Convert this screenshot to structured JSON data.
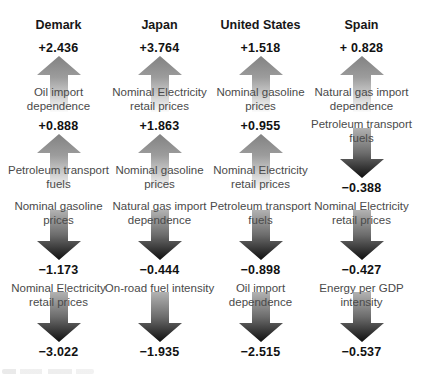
{
  "figure": {
    "colors": {
      "value_text": "#111111",
      "label_text": "#4a4a4a",
      "up_arrow_top": "#828282",
      "up_arrow_bottom": "#fbfbfb",
      "down_arrow_top": "#b2b2b2",
      "down_arrow_bottom": "#0f0f0f",
      "background": "#ffffff"
    },
    "columns": [
      {
        "country": "Demark",
        "items": [
          {
            "direction": "up",
            "value": "+2.436",
            "label": "Oil import dependence"
          },
          {
            "direction": "up",
            "value": "+0.888",
            "label": "Petroleum transport fuels"
          },
          {
            "direction": "down",
            "value": "−1.173",
            "label": "Nominal gasoline prices"
          },
          {
            "direction": "down",
            "value": "−3.022",
            "label": "Nominal Electricity retail prices"
          }
        ]
      },
      {
        "country": "Japan",
        "items": [
          {
            "direction": "up",
            "value": "+3.764",
            "label": "Nominal Electricity retail prices"
          },
          {
            "direction": "up",
            "value": "+1.863",
            "label": "Nominal gasoline prices"
          },
          {
            "direction": "down",
            "value": "−0.444",
            "label": "Natural gas import dependence"
          },
          {
            "direction": "down",
            "value": "−1.935",
            "label": "On-road fuel intensity"
          }
        ]
      },
      {
        "country": "United States",
        "items": [
          {
            "direction": "up",
            "value": "+1.518",
            "label": "Nominal gasoline prices"
          },
          {
            "direction": "up",
            "value": "+0.955",
            "label": "Nominal Electricity retail prices"
          },
          {
            "direction": "down",
            "value": "−0.898",
            "label": "Petroleum transport fuels"
          },
          {
            "direction": "down",
            "value": "−2.515",
            "label": "Oil import dependence"
          }
        ]
      },
      {
        "country": "Spain",
        "items": [
          {
            "direction": "up",
            "value": "+ 0.828",
            "label": "Natural gas import dependence"
          },
          {
            "direction": "down",
            "value": "−0.388",
            "label": "Petroleum transport fuels"
          },
          {
            "direction": "down",
            "value": "−0.427",
            "label": "Nominal Electricity retail prices"
          },
          {
            "direction": "down",
            "value": "−0.537",
            "label": "Energy per GDP intensity"
          }
        ]
      }
    ]
  }
}
